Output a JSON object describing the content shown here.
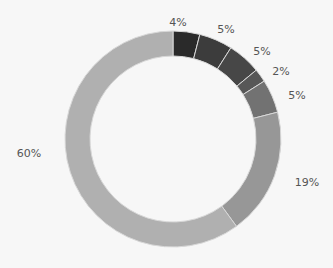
{
  "chart_data": {
    "type": "pie",
    "variant": "donut",
    "title": "",
    "legend": "none",
    "categories": [
      "Segment 1",
      "Segment 2",
      "Segment 3",
      "Segment 4",
      "Segment 5",
      "Segment 6",
      "Segment 7"
    ],
    "values": [
      4,
      5,
      5,
      2,
      5,
      19,
      60
    ],
    "labels": [
      "4%",
      "5%",
      "5%",
      "2%",
      "5%",
      "19%",
      "60%"
    ],
    "colors": [
      "#2a2a2a",
      "#3c3c3c",
      "#474747",
      "#575757",
      "#727272",
      "#979797",
      "#b0b0b0"
    ],
    "start_angle": "12 o'clock, clockwise"
  },
  "label_positions": [
    {
      "x": 178,
      "y": 26
    },
    {
      "x": 226,
      "y": 33
    },
    {
      "x": 262,
      "y": 55
    },
    {
      "x": 281,
      "y": 75
    },
    {
      "x": 297,
      "y": 99
    },
    {
      "x": 307,
      "y": 186
    },
    {
      "x": 29,
      "y": 157
    }
  ]
}
